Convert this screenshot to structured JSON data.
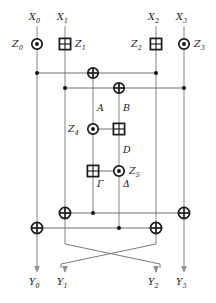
{
  "figure": {
    "type": "quantum-reversible circuit",
    "width": 216,
    "height": 303,
    "background_color": "#ffffff",
    "wire_color": "#8f8f8f",
    "gate_color": "#1a1a1a"
  },
  "inputs": [
    {
      "id": "x0",
      "label": "X",
      "sub": "0",
      "x": 37
    },
    {
      "id": "x1",
      "label": "X",
      "sub": "1",
      "x": 65
    },
    {
      "id": "x2",
      "label": "X",
      "sub": "2",
      "x": 156
    },
    {
      "id": "x3",
      "label": "X",
      "sub": "3",
      "x": 184
    }
  ],
  "outputs": [
    {
      "id": "y0",
      "label": "Y",
      "sub": "0",
      "x": 37
    },
    {
      "id": "y1",
      "label": "Y",
      "sub": "1",
      "x": 65
    },
    {
      "id": "y2",
      "label": "Y",
      "sub": "2",
      "x": 156
    },
    {
      "id": "y3",
      "label": "Y",
      "sub": "3",
      "x": 184
    }
  ],
  "ancillas": [
    {
      "id": "z0",
      "label": "Z",
      "sub": "0",
      "side": "left",
      "gate": "circle-dot",
      "x": 37,
      "y": 44
    },
    {
      "id": "z1",
      "label": "Z",
      "sub": "1",
      "side": "right",
      "gate": "crossed-square",
      "x": 65,
      "y": 44
    },
    {
      "id": "z2",
      "label": "Z",
      "sub": "2",
      "side": "left",
      "gate": "crossed-square",
      "x": 156,
      "y": 44
    },
    {
      "id": "z3",
      "label": "Z",
      "sub": "3",
      "side": "right",
      "gate": "circle-dot",
      "x": 184,
      "y": 44
    },
    {
      "id": "z4",
      "label": "Z",
      "sub": "4",
      "side": "left",
      "gate": "circle-dot",
      "x": 93,
      "y": 129
    },
    {
      "id": "z5",
      "label": "Z",
      "sub": "5",
      "side": "right",
      "gate": "circle-dot",
      "x": 119,
      "y": 171
    }
  ],
  "segment_labels": [
    {
      "id": "seg-a",
      "text": "A",
      "x": 98,
      "y": 108
    },
    {
      "id": "seg-b",
      "text": "B",
      "x": 124,
      "y": 108
    },
    {
      "id": "seg-d",
      "text": "D",
      "x": 124,
      "y": 150
    },
    {
      "id": "seg-gamma",
      "text": "Γ",
      "x": 98,
      "y": 184
    },
    {
      "id": "seg-delta",
      "text": "Δ",
      "x": 124,
      "y": 184
    }
  ],
  "gates": [
    {
      "id": "g-z0",
      "type": "circle-dot",
      "x": 37,
      "y": 44
    },
    {
      "id": "g-z1",
      "type": "crossed-square",
      "x": 65,
      "y": 44
    },
    {
      "id": "g-z2",
      "type": "crossed-square",
      "x": 156,
      "y": 44
    },
    {
      "id": "g-z3",
      "type": "circle-dot",
      "x": 184,
      "y": 44
    },
    {
      "id": "g-xor-top",
      "type": "xor-circle",
      "x": 93,
      "y": 73
    },
    {
      "id": "g-xor-second",
      "type": "xor-circle",
      "x": 119,
      "y": 88
    },
    {
      "id": "g-z4",
      "type": "circle-dot",
      "x": 93,
      "y": 129
    },
    {
      "id": "g-b-square",
      "type": "crossed-square",
      "x": 119,
      "y": 129
    },
    {
      "id": "g-gamma-square",
      "type": "crossed-square",
      "x": 93,
      "y": 171
    },
    {
      "id": "g-z5",
      "type": "circle-dot",
      "x": 119,
      "y": 171
    },
    {
      "id": "g-xor-bl",
      "type": "xor-circle",
      "x": 65,
      "y": 213
    },
    {
      "id": "g-xor-br",
      "type": "xor-circle",
      "x": 184,
      "y": 213
    },
    {
      "id": "g-xor-ll",
      "type": "xor-circle",
      "x": 37,
      "y": 228
    },
    {
      "id": "g-xor-rr",
      "type": "xor-circle",
      "x": 156,
      "y": 228
    }
  ],
  "control_dots": [
    {
      "id": "ctrl-top-left",
      "x": 37,
      "y": 73
    },
    {
      "id": "ctrl-top-right",
      "x": 156,
      "y": 73
    },
    {
      "id": "ctrl-second-left",
      "x": 65,
      "y": 88
    },
    {
      "id": "ctrl-second-right",
      "x": 184,
      "y": 88
    },
    {
      "id": "ctrl-bl",
      "x": 93,
      "y": 213
    },
    {
      "id": "ctrl-ll",
      "x": 119,
      "y": 228
    }
  ],
  "rails": [
    {
      "id": "rail-top",
      "y": 73,
      "x1": 37,
      "x2": 156
    },
    {
      "id": "rail-second",
      "y": 88,
      "x1": 65,
      "x2": 184
    },
    {
      "id": "rail-z4",
      "y": 129,
      "x1": 93,
      "x2": 119
    },
    {
      "id": "rail-z5",
      "y": 171,
      "x1": 93,
      "x2": 119
    },
    {
      "id": "rail-lower-a",
      "y": 213,
      "x1": 65,
      "x2": 184
    },
    {
      "id": "rail-lower-b",
      "y": 228,
      "x1": 37,
      "x2": 156
    }
  ],
  "swap": {
    "id": "swap-crossing",
    "description": "wires X1 and X2 cross before outputs Y1 and Y2",
    "pairs": [
      {
        "from_x": 65,
        "to_x": 156
      },
      {
        "from_x": 156,
        "to_x": 65
      }
    ],
    "y_start": 240,
    "y_end": 268
  }
}
